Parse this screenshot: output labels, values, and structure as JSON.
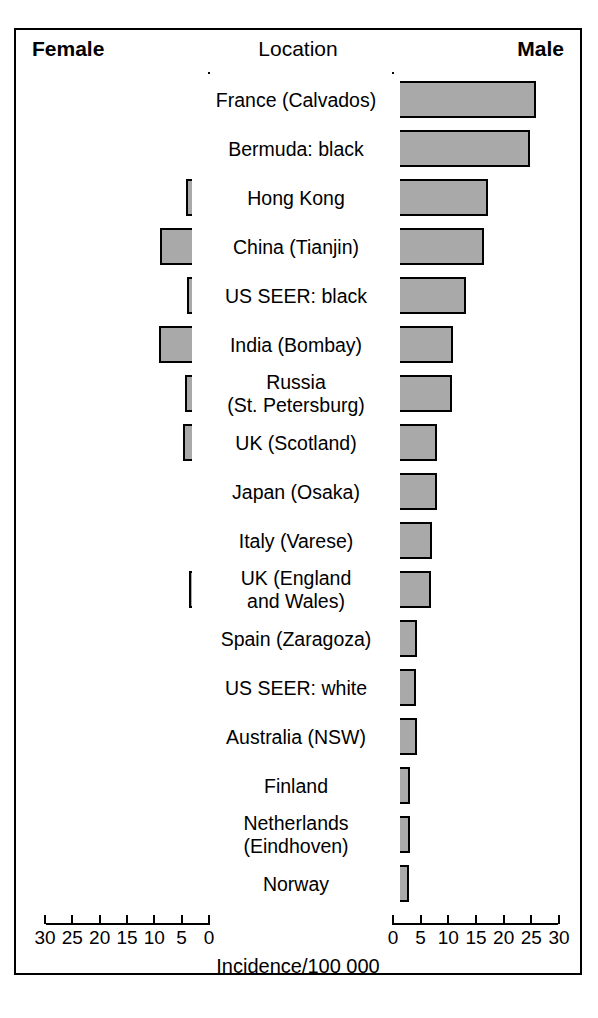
{
  "header": {
    "left_label": "Female",
    "center_label": "Location",
    "right_label": "Male"
  },
  "axis": {
    "xlabel": "Incidence/100 000",
    "left_ticks": [
      "30",
      "25",
      "20",
      "15",
      "10",
      "5",
      "0"
    ],
    "right_ticks": [
      "0",
      "5",
      "10",
      "15",
      "20",
      "25",
      "30"
    ],
    "min": 0,
    "max": 30
  },
  "colors": {
    "bar_fill": "#a9a9a9",
    "bar_stroke": "#000000",
    "frame": "#000000",
    "background": "#ffffff",
    "text": "#000000"
  },
  "chart_data": {
    "type": "bar",
    "orientation": "horizontal",
    "style": "population-pyramid",
    "title": "",
    "xlabel": "Incidence/100 000",
    "ylabel": "Location",
    "xlim": [
      0,
      30
    ],
    "grid": false,
    "legend": [
      "Female",
      "Male"
    ],
    "legend_position": "top-corners",
    "categories": [
      "France (Calvados)",
      "Bermuda: black",
      "Hong Kong",
      "China (Tianjin)",
      "US SEER: black",
      "India (Bombay)",
      "Russia (St. Petersburg)",
      "UK (Scotland)",
      "Japan (Osaka)",
      "Italy (Varese)",
      "UK (England and Wales)",
      "Spain (Zaragoza)",
      "US SEER: white",
      "Australia (NSW)",
      "Finland",
      "Netherlands (Eindhoven)",
      "Norway"
    ],
    "series": [
      {
        "name": "Female",
        "values": [
          2.7,
          1.0,
          4.0,
          8.8,
          3.8,
          9.0,
          4.2,
          4.6,
          2.4,
          1.1,
          3.5,
          1.5,
          1.8,
          3.0,
          2.7,
          1.8,
          1.4
        ]
      },
      {
        "name": "Male",
        "values": [
          26.0,
          25.0,
          17.4,
          16.6,
          13.4,
          11.0,
          10.8,
          8.1,
          8.1,
          7.2,
          7.0,
          4.5,
          4.4,
          4.5,
          3.3,
          3.3,
          3.0
        ]
      }
    ]
  },
  "rows": [
    {
      "label": "France (Calvados)",
      "label_lines": [
        "France (Calvados)"
      ],
      "female": 2.7,
      "male": 26.0
    },
    {
      "label": "Bermuda: black",
      "label_lines": [
        "Bermuda: black"
      ],
      "female": 1.0,
      "male": 25.0
    },
    {
      "label": "Hong Kong",
      "label_lines": [
        "Hong Kong"
      ],
      "female": 4.0,
      "male": 17.4
    },
    {
      "label": "China (Tianjin)",
      "label_lines": [
        "China (Tianjin)"
      ],
      "female": 8.8,
      "male": 16.6
    },
    {
      "label": "US SEER: black",
      "label_lines": [
        "US SEER: black"
      ],
      "female": 3.8,
      "male": 13.4
    },
    {
      "label": "India (Bombay)",
      "label_lines": [
        "India (Bombay)"
      ],
      "female": 9.0,
      "male": 11.0
    },
    {
      "label": "Russia (St. Petersburg)",
      "label_lines": [
        "Russia",
        "(St. Petersburg)"
      ],
      "female": 4.2,
      "male": 10.8
    },
    {
      "label": "UK (Scotland)",
      "label_lines": [
        "UK (Scotland)"
      ],
      "female": 4.6,
      "male": 8.1
    },
    {
      "label": "Japan (Osaka)",
      "label_lines": [
        "Japan (Osaka)"
      ],
      "female": 2.4,
      "male": 8.1
    },
    {
      "label": "Italy (Varese)",
      "label_lines": [
        "Italy (Varese)"
      ],
      "female": 1.1,
      "male": 7.2
    },
    {
      "label": "UK (England and Wales)",
      "label_lines": [
        "UK (England",
        "and Wales)"
      ],
      "female": 3.5,
      "male": 7.0
    },
    {
      "label": "Spain (Zaragoza)",
      "label_lines": [
        "Spain (Zaragoza)"
      ],
      "female": 1.5,
      "male": 4.5
    },
    {
      "label": "US SEER: white",
      "label_lines": [
        "US SEER: white"
      ],
      "female": 1.8,
      "male": 4.4
    },
    {
      "label": "Australia (NSW)",
      "label_lines": [
        "Australia (NSW)"
      ],
      "female": 3.0,
      "male": 4.5
    },
    {
      "label": "Finland",
      "label_lines": [
        "Finland"
      ],
      "female": 2.7,
      "male": 3.3
    },
    {
      "label": "Netherlands (Eindhoven)",
      "label_lines": [
        "Netherlands",
        "(Eindhoven)"
      ],
      "female": 1.8,
      "male": 3.3
    },
    {
      "label": "Norway",
      "label_lines": [
        "Norway"
      ],
      "female": 1.4,
      "male": 3.0
    }
  ]
}
